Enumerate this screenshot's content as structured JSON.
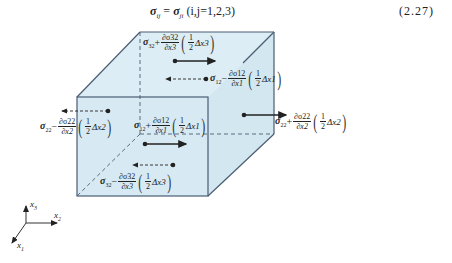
{
  "equation": {
    "lhs_symbol": "σ",
    "lhs_sub": "ij",
    "equals": "=",
    "rhs_symbol": "σ",
    "rhs_sub": "ji",
    "condition": "(i,j=1,2,3)",
    "number": "(2.27)"
  },
  "cube": {
    "fill": "#d7eaf3",
    "edge_color": "#4a5d73",
    "front_face": {
      "x1": 77,
      "y1": 97,
      "x2": 208,
      "y2": 196
    },
    "back_face": {
      "x1": 140,
      "y1": 32,
      "x2": 274,
      "y2": 134
    }
  },
  "labels": [
    {
      "id": "top-x1-plus",
      "sigma_sub": "32",
      "sign": "+",
      "deriv_num": "∂σ32",
      "deriv_den": "∂x3",
      "half": "1/2",
      "delta": "Δx3",
      "arrow": "solid-right"
    },
    {
      "id": "back-x1-minus",
      "sigma_sub": "12",
      "sign": "−",
      "deriv_num": "∂σ12",
      "deriv_den": "∂x1",
      "half": "1/2",
      "delta": "Δx1",
      "arrow": "dashed-left"
    },
    {
      "id": "left-x2-minus",
      "sigma_sub": "22",
      "sign": "−",
      "deriv_num": "∂σ22",
      "deriv_den": "∂x2",
      "half": "1/2",
      "delta": "Δx2",
      "arrow": "dashed-left"
    },
    {
      "id": "front-x1-plus",
      "sigma_sub": "12",
      "sign": "+",
      "deriv_num": "∂σ12",
      "deriv_den": "∂x1",
      "half": "1/2",
      "delta": "Δx1",
      "arrow": "solid-right"
    },
    {
      "id": "right-x2-plus",
      "sigma_sub": "22",
      "sign": "+",
      "deriv_num": "∂σ22",
      "deriv_den": "∂x2",
      "half": "1/2",
      "delta": "Δx2",
      "arrow": "solid-right"
    },
    {
      "id": "bottom-x3-minus",
      "sigma_sub": "32",
      "sign": "−",
      "deriv_num": "∂σ32",
      "deriv_den": "∂x3",
      "half": "1/2",
      "delta": "Δx3",
      "arrow": "dashed-left"
    }
  ],
  "axes": {
    "x1": "x",
    "x1_sub": "1",
    "x2": "x",
    "x2_sub": "2",
    "x3": "x",
    "x3_sub": "3"
  }
}
